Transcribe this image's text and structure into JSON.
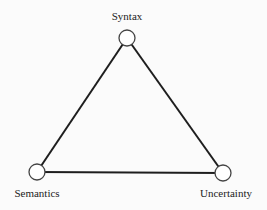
{
  "diagram": {
    "type": "triangle",
    "edge_color": "#1e1e1e",
    "node_stroke_color": "#444444",
    "node_fill_color": "#ffffff",
    "nodes": [
      {
        "id": "syntax",
        "label": "Syntax",
        "cx": 127,
        "cy": 38,
        "label_x": 127,
        "label_y": 10
      },
      {
        "id": "semantics",
        "label": "Semantics",
        "cx": 37,
        "cy": 172,
        "label_x": 37,
        "label_y": 187
      },
      {
        "id": "uncertainty",
        "label": "Uncertainty",
        "cx": 223,
        "cy": 173,
        "label_x": 226,
        "label_y": 187
      }
    ],
    "edges": [
      {
        "from": "syntax",
        "to": "semantics"
      },
      {
        "from": "syntax",
        "to": "uncertainty"
      },
      {
        "from": "semantics",
        "to": "uncertainty"
      }
    ]
  }
}
